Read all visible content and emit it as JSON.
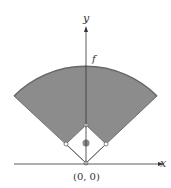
{
  "diagram": {
    "type": "baseball-field-coordinate-diagram",
    "axes": {
      "x_label": "x",
      "y_label": "y",
      "origin_label": "(0, 0)"
    },
    "curve_label": "f",
    "colors": {
      "outfield": "#8c8c8c",
      "arc": "#666666",
      "axes": "#333333",
      "background": "#ffffff"
    }
  }
}
